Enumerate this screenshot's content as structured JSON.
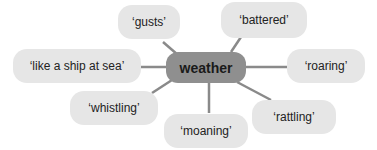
{
  "diagram": {
    "center": {
      "label": "weather",
      "color": "#8f8f8f"
    },
    "node_color": "#e6e6e6",
    "link_color": "#8a8a8a",
    "nodes": [
      {
        "id": "gusts",
        "label": "‘gusts’"
      },
      {
        "id": "battered",
        "label": "‘battered’"
      },
      {
        "id": "ship",
        "label": "‘like a ship at sea’"
      },
      {
        "id": "roaring",
        "label": "‘roaring’"
      },
      {
        "id": "whistling",
        "label": "‘whistling’"
      },
      {
        "id": "moaning",
        "label": "‘moaning’"
      },
      {
        "id": "rattling",
        "label": "‘rattling’"
      }
    ]
  }
}
